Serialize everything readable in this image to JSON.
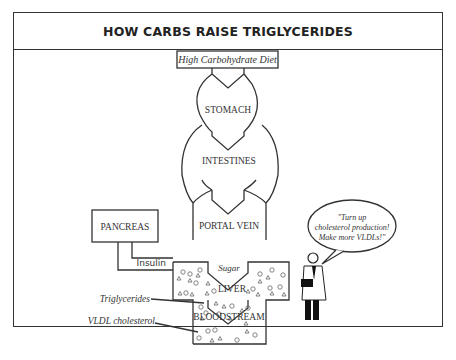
{
  "title": "HOW CARBS RAISE TRIGLYCERIDES",
  "diagram": {
    "source": "High Carbohydrate Diet",
    "stages": [
      "STOMACH",
      "INTESTINES",
      "PORTAL VEIN",
      "LIVER",
      "BLOODSTREAM"
    ],
    "side_organ": "PANCREAS",
    "signal": "Insulin",
    "flow_label": "Sugar",
    "legend": {
      "triglycerides": "Triglycerides",
      "vldl": "VLDL cholesterol"
    },
    "speech_bubble": [
      "\"Turn up",
      "cholesterol production!",
      "Make more VLDLs!\""
    ],
    "symbols": {
      "triglycerides": "triangle",
      "vldl": "circle"
    }
  }
}
